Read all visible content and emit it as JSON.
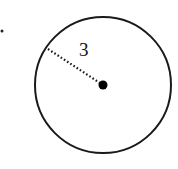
{
  "diagram": {
    "type": "circle-with-radius",
    "bullet_marker": {
      "cx": 2,
      "cy": 31,
      "r": 1.5
    },
    "circle": {
      "cx": 103,
      "cy": 85,
      "r": 68,
      "stroke": "#1a1a1a",
      "stroke_width": 2
    },
    "center_point": {
      "cx": 103,
      "cy": 85,
      "r": 4.5,
      "fill": "#000000"
    },
    "radius_line": {
      "x1": 48,
      "y1": 49,
      "x2": 103,
      "y2": 85,
      "style": "dotted"
    },
    "radius_label": {
      "text": "3",
      "x": 79,
      "y": 56
    }
  }
}
